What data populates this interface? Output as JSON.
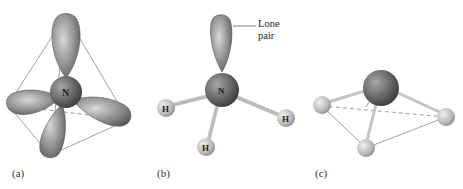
{
  "figure": {
    "panels": [
      {
        "id": "a",
        "label": "(a)",
        "central_atom": "N",
        "description": "tetrahedral arrangement of four hybrid orbitals"
      },
      {
        "id": "b",
        "label": "(b)",
        "central_atom": "N",
        "substituents": [
          "H",
          "H",
          "H"
        ],
        "annotation": "Lone pair"
      },
      {
        "id": "c",
        "label": "(c)",
        "description": "trigonal pyramidal shape"
      }
    ],
    "annotations": {
      "lone_pair_line1": "Lone",
      "lone_pair_line2": "pair"
    },
    "atoms": {
      "nitrogen": "N",
      "hydrogen": "H"
    },
    "colors": {
      "lobe": "#8a8a8a",
      "nitrogen": "#6a6a6a",
      "hydrogen": "#bdbdbd",
      "line": "#777777"
    }
  }
}
